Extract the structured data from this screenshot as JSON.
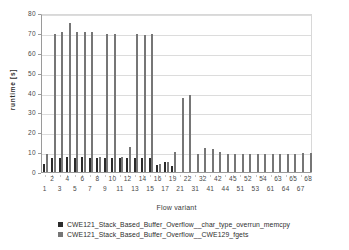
{
  "chart_data": {
    "type": "bar",
    "title": "",
    "xlabel": "Flow variant",
    "ylabel": "runtime [s]",
    "ylim": [
      0,
      80
    ],
    "yticks": [
      0,
      10,
      20,
      30,
      40,
      50,
      60,
      70,
      80
    ],
    "grid": true,
    "legend_position": "bottom",
    "categories": [
      "1",
      "2",
      "3",
      "4",
      "5",
      "6",
      "7",
      "8",
      "9",
      "10",
      "11",
      "12",
      "13",
      "14",
      "15",
      "16",
      "17",
      "19",
      "21",
      "22",
      "31",
      "32",
      "41",
      "42",
      "44",
      "45",
      "51",
      "52",
      "53",
      "54",
      "61",
      "63",
      "64",
      "65",
      "67",
      "68"
    ],
    "series": [
      {
        "name": "CWE121_Stack_Based_Buffer_Overflow__char_type_overrun_memcpy",
        "color": "#2b2b2b",
        "values": [
          4.0,
          7.3,
          7.0,
          7.4,
          7.0,
          7.8,
          7.3,
          7.2,
          7.2,
          7.2,
          7.3,
          7.3,
          7.2,
          7.3,
          7.2,
          3.6,
          4.8,
          3.2,
          0,
          0,
          0,
          0,
          0,
          0,
          0,
          0,
          0,
          0,
          0,
          0,
          0,
          0,
          0,
          0,
          0,
          0
        ]
      },
      {
        "name": "CWE121_Stack_Based_Buffer_Overflow__CWE129_fgets",
        "color": "#767676",
        "values": [
          9.3,
          69.6,
          70.5,
          75.0,
          70.6,
          70.6,
          70.4,
          7.4,
          69.6,
          69.4,
          7.6,
          12.4,
          69.5,
          68.8,
          69.2,
          4.0,
          5.0,
          9.9,
          37.4,
          39.0,
          9.2,
          12.2,
          11.5,
          10.3,
          9.3,
          9.3,
          9.3,
          9.2,
          9.2,
          9.2,
          9.2,
          9.2,
          9.3,
          9.3,
          9.4,
          9.7
        ]
      }
    ],
    "xtick_rows": [
      [
        "2",
        "4",
        "6",
        "8",
        "10",
        "12",
        "14",
        "16",
        "19",
        "22",
        "32",
        "42",
        "45",
        "52",
        "54",
        "63",
        "65",
        "68"
      ],
      [
        "1",
        "3",
        "5",
        "7",
        "9",
        "11",
        "13",
        "15",
        "17",
        "21",
        "31",
        "41",
        "44",
        "51",
        "53",
        "61",
        "64",
        "67"
      ]
    ]
  },
  "legend": {
    "items": [
      {
        "label": "CWE121_Stack_Based_Buffer_Overflow__char_type_overrun_memcpy",
        "color": "#2b2b2b"
      },
      {
        "label": "CWE121_Stack_Based_Buffer_Overflow__CWE129_fgets",
        "color": "#767676"
      }
    ]
  }
}
